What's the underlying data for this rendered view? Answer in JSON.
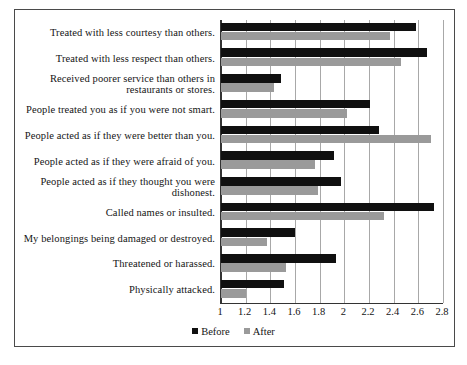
{
  "chart_data": {
    "type": "bar",
    "orientation": "horizontal",
    "title": "",
    "xlabel": "",
    "ylabel": "",
    "xlim": [
      1,
      2.8
    ],
    "xticks": [
      "1",
      "1.2",
      "1.4",
      "1.6",
      "1.8",
      "2",
      "2.2",
      "2.4",
      "2.6",
      "2.8"
    ],
    "xtick_values": [
      1,
      1.2,
      1.4,
      1.6,
      1.8,
      2,
      2.2,
      2.4,
      2.6,
      2.8
    ],
    "grid": true,
    "grid_axis": "x",
    "legend_position": "bottom",
    "categories": [
      "Treated with less courtesy than others.",
      "Treated with less respect than others.",
      "Received poorer service than others in restaurants or stores.",
      "People treated you as if you were not smart.",
      "People acted as if they were better than you.",
      "People acted as if they were afraid of you.",
      "People acted as if they thought you were dishonest.",
      "Called names or insulted.",
      "My belongings being damaged or destroyed.",
      "Threatened or harassed.",
      "Physically attacked."
    ],
    "series": [
      {
        "name": "Before",
        "color": "#101010",
        "values": [
          2.58,
          2.67,
          1.49,
          2.21,
          2.28,
          1.92,
          1.97,
          2.73,
          1.6,
          1.93,
          1.51
        ]
      },
      {
        "name": "After",
        "color": "#9a9a9a",
        "values": [
          2.37,
          2.46,
          1.43,
          2.02,
          2.7,
          1.76,
          1.79,
          2.32,
          1.37,
          1.53,
          1.2
        ]
      }
    ]
  },
  "legend": {
    "items": [
      {
        "label": "Before",
        "color": "#101010"
      },
      {
        "label": "After",
        "color": "#9a9a9a"
      }
    ]
  }
}
